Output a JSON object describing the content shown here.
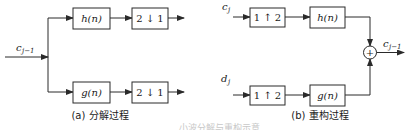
{
  "decomposition": {
    "input_label": "c",
    "input_sub": "j−1",
    "top_filter": "h(n)",
    "bottom_filter": "g(n)",
    "downsample_top": "2 ↓ 1",
    "downsample_bottom": "2 ↓ 1",
    "caption": "(a) 分解过程"
  },
  "reconstruction": {
    "top_input_label": "c",
    "top_input_sub": "j",
    "bottom_input_label": "d",
    "bottom_input_sub": "j",
    "upsample_top": "1 ↑ 2",
    "upsample_bottom": "1 ↑ 2",
    "top_filter": "h(n)",
    "bottom_filter": "g(n)",
    "sum_symbol": "+",
    "output_label": "c",
    "output_sub": "j−1",
    "caption": "(b) 重构过程"
  },
  "figure_caption_partial": "……小波分解与重构示意"
}
